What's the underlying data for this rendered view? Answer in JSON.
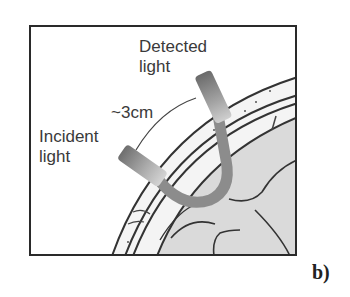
{
  "figure": {
    "panel_label": "b)",
    "labels": {
      "detected_line1": "Detected",
      "detected_line2": "light",
      "distance": "~3cm",
      "incident_line1": "Incident",
      "incident_line2": "light"
    },
    "colors": {
      "frame": "#2a2a2a",
      "tissue_line": "#333333",
      "brain_fill": "#d9d9d9",
      "scalp_fill": "#f2f2f2",
      "light_path": "#8a8a8a",
      "probe_dark": "#777777",
      "probe_light": "#c8c8c8"
    }
  }
}
